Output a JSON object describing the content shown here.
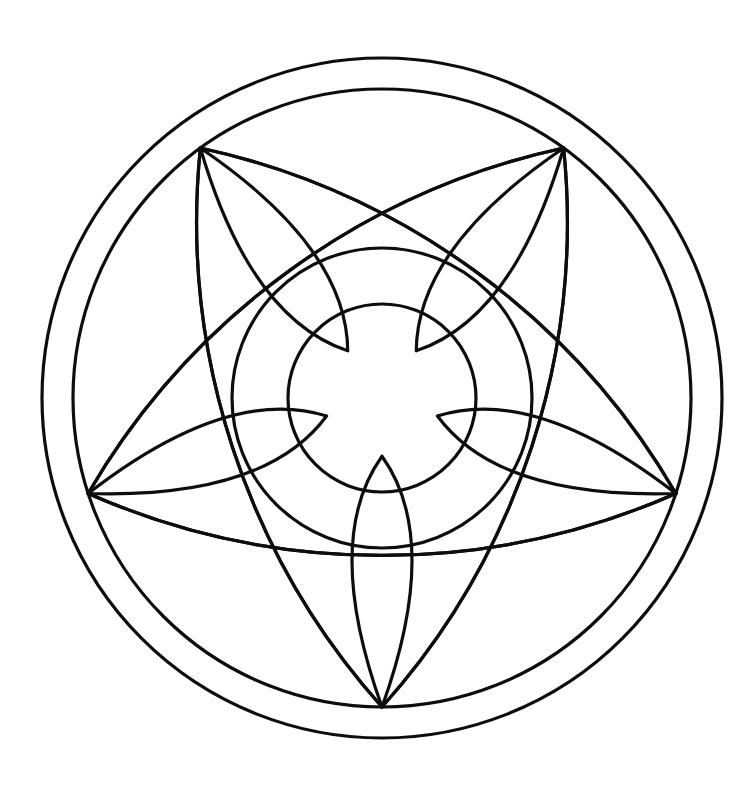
{
  "page": {
    "background_color": "#ffffff",
    "stroke_color": "#0d0d0d",
    "width": 744,
    "height": 796
  },
  "figure": {
    "name": "pentagonal-star-mandala",
    "center": {
      "x": 382,
      "y": 398
    },
    "stroke_width": 3.2,
    "circles": [
      {
        "name": "outer-ring-circle",
        "radius": 340
      },
      {
        "name": "inner-ring-circle",
        "radius": 309
      },
      {
        "name": "middle-circle",
        "radius": 150
      },
      {
        "name": "center-circle",
        "radius": 94
      }
    ],
    "pentagon": {
      "name": "vertex-pentagon",
      "circumradius": 309,
      "vertex_count": 5,
      "rotation_degrees": 90,
      "vertex_angles_degrees": [
        90,
        162,
        234,
        306,
        18
      ],
      "vertex_labels": [
        "bottom",
        "left",
        "upper-left",
        "upper-right",
        "right"
      ]
    },
    "star_arcs": {
      "name": "star-point-arcs",
      "count": 10,
      "description": "Arcs joining each pentagon vertex to its two non-adjacent vertices, bowing inward to graze the middle circle and produce five curved star points.",
      "sagitta_ratio": 0.62
    },
    "petals": {
      "name": "petal-lenses",
      "count": 5,
      "description": "Lens / pointed-oval petals radiating from the central circle out to each pentagon vertex."
    }
  }
}
